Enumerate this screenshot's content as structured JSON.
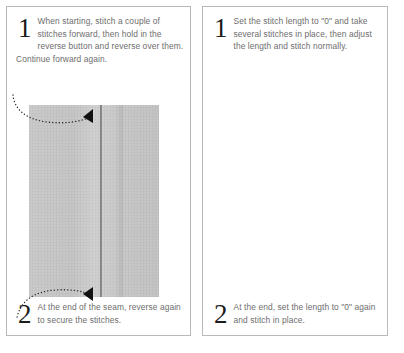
{
  "document": {
    "title": "Reverse stitching and lock stitch instructions",
    "background_color": "#ffffff",
    "text_color": "#6d6d6d",
    "border_color": "#b9b9b9",
    "fabric_color": "#c7c7c7",
    "seam_color": "#6d6d6d",
    "arrow_color": "#262626"
  },
  "panels": [
    {
      "id": "panel-reverse-stitch",
      "steps": [
        {
          "number": "1",
          "text": "When starting, stitch a couple of stitches forward, then hold in the reverse button and reverse over them. Continue forward again."
        },
        {
          "number": "2",
          "text": "At the end of the seam, reverse again to secure the stitches."
        }
      ],
      "figure": {
        "name": "fabric-seam-photo",
        "description": "Grayscale photo of two fabric pieces joined by a vertical seam",
        "annotations": [
          {
            "name": "top-arrow",
            "points_to": "seam start"
          },
          {
            "name": "bottom-arrow",
            "points_to": "seam end"
          }
        ]
      }
    },
    {
      "id": "panel-zero-length-stitch",
      "steps": [
        {
          "number": "1",
          "text": "Set the stitch length to \"0\" and take several stitches in place, then adjust the length and stitch normally."
        },
        {
          "number": "2",
          "text": "At the end, set the length to \"0\" again and stitch in place."
        }
      ],
      "figure": {
        "name": "fabric-seam-photo",
        "description": "Grayscale photo of two fabric pieces joined by a vertical seam",
        "annotations": [
          {
            "name": "top-arrow",
            "points_to": "seam start"
          },
          {
            "name": "bottom-arrow",
            "points_to": "seam end"
          }
        ]
      }
    }
  ]
}
